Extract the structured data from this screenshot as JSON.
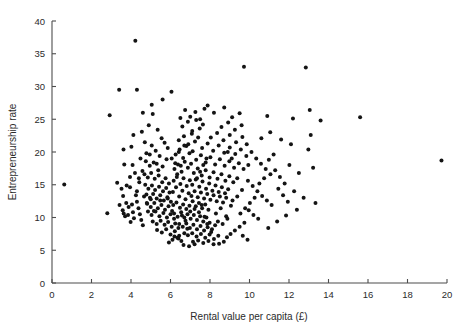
{
  "chart_data": {
    "type": "scatter",
    "title": "",
    "xlabel": "Rental value per capita (£)",
    "ylabel": "Entrepreneurship rate",
    "xlim": [
      0,
      20
    ],
    "ylim": [
      0,
      40
    ],
    "xticks": [
      0,
      2,
      4,
      6,
      8,
      10,
      12,
      14,
      16,
      18,
      20
    ],
    "yticks": [
      0,
      5,
      10,
      15,
      20,
      25,
      30,
      35,
      40
    ],
    "grid": false,
    "legend": null,
    "marker": {
      "shape": "circle",
      "color": "#141414",
      "size_px": 4
    },
    "n_points": 430,
    "points": [
      [
        0.62,
        15.05
      ],
      [
        2.8,
        10.65
      ],
      [
        2.92,
        25.6
      ],
      [
        3.4,
        29.5
      ],
      [
        4.3,
        29.5
      ],
      [
        4.22,
        37.0
      ],
      [
        3.62,
        20.4
      ],
      [
        3.66,
        18.1
      ],
      [
        3.3,
        15.3
      ],
      [
        3.52,
        14.4
      ],
      [
        3.78,
        14.9
      ],
      [
        3.95,
        14.6
      ],
      [
        3.6,
        13.3
      ],
      [
        3.76,
        12.2
      ],
      [
        3.42,
        11.9
      ],
      [
        3.58,
        11.1
      ],
      [
        3.63,
        10.6
      ],
      [
        3.7,
        10.2
      ],
      [
        3.85,
        10.4
      ],
      [
        3.88,
        11.6
      ],
      [
        4.05,
        12.0
      ],
      [
        4.1,
        10.8
      ],
      [
        4.15,
        9.9
      ],
      [
        3.98,
        9.3
      ],
      [
        4.25,
        13.4
      ],
      [
        4.3,
        12.4
      ],
      [
        4.38,
        11.4
      ],
      [
        4.45,
        10.5
      ],
      [
        4.52,
        9.6
      ],
      [
        4.6,
        8.8
      ],
      [
        4.12,
        22.6
      ],
      [
        4.55,
        23.1
      ],
      [
        4.02,
        20.8
      ],
      [
        4.48,
        19.0
      ],
      [
        4.7,
        21.5
      ],
      [
        4.9,
        24.1
      ],
      [
        5.1,
        25.8
      ],
      [
        5.35,
        23.4
      ],
      [
        5.55,
        22.1
      ],
      [
        5.05,
        21.0
      ],
      [
        5.25,
        20.2
      ],
      [
        5.45,
        19.4
      ],
      [
        4.75,
        18.6
      ],
      [
        4.95,
        17.9
      ],
      [
        5.15,
        18.4
      ],
      [
        5.38,
        17.2
      ],
      [
        5.6,
        17.8
      ],
      [
        5.8,
        18.9
      ],
      [
        4.68,
        16.6
      ],
      [
        4.85,
        16.1
      ],
      [
        5.02,
        16.8
      ],
      [
        5.2,
        15.9
      ],
      [
        5.4,
        16.4
      ],
      [
        5.58,
        15.4
      ],
      [
        5.75,
        16.0
      ],
      [
        5.92,
        15.2
      ],
      [
        4.72,
        15.0
      ],
      [
        4.88,
        14.4
      ],
      [
        5.06,
        14.9
      ],
      [
        5.22,
        14.2
      ],
      [
        5.42,
        14.7
      ],
      [
        5.62,
        14.0
      ],
      [
        5.78,
        14.5
      ],
      [
        5.95,
        13.8
      ],
      [
        4.78,
        13.5
      ],
      [
        4.96,
        13.0
      ],
      [
        5.12,
        13.6
      ],
      [
        5.3,
        12.9
      ],
      [
        5.48,
        13.4
      ],
      [
        5.66,
        12.6
      ],
      [
        5.84,
        13.1
      ],
      [
        6.02,
        12.4
      ],
      [
        4.82,
        12.1
      ],
      [
        5.0,
        11.6
      ],
      [
        5.18,
        12.2
      ],
      [
        5.36,
        11.4
      ],
      [
        5.54,
        11.9
      ],
      [
        5.72,
        11.2
      ],
      [
        5.9,
        11.7
      ],
      [
        6.08,
        11.0
      ],
      [
        4.86,
        10.9
      ],
      [
        5.04,
        10.4
      ],
      [
        5.24,
        10.9
      ],
      [
        5.44,
        10.2
      ],
      [
        5.64,
        10.7
      ],
      [
        5.82,
        10.0
      ],
      [
        6.0,
        10.5
      ],
      [
        6.18,
        9.8
      ],
      [
        5.1,
        9.4
      ],
      [
        5.3,
        9.0
      ],
      [
        5.5,
        9.5
      ],
      [
        5.7,
        8.9
      ],
      [
        5.88,
        9.3
      ],
      [
        6.06,
        8.6
      ],
      [
        6.24,
        9.1
      ],
      [
        6.4,
        8.4
      ],
      [
        5.32,
        8.1
      ],
      [
        5.56,
        7.7
      ],
      [
        5.78,
        8.2
      ],
      [
        6.0,
        7.4
      ],
      [
        6.22,
        7.9
      ],
      [
        6.44,
        7.2
      ],
      [
        6.1,
        6.6
      ],
      [
        6.35,
        6.9
      ],
      [
        5.92,
        6.2
      ],
      [
        6.55,
        6.4
      ],
      [
        6.7,
        7.6
      ],
      [
        6.85,
        8.3
      ],
      [
        6.12,
        13.9
      ],
      [
        6.28,
        14.6
      ],
      [
        6.44,
        13.2
      ],
      [
        6.6,
        14.1
      ],
      [
        6.76,
        12.8
      ],
      [
        6.92,
        13.7
      ],
      [
        6.16,
        15.6
      ],
      [
        6.32,
        16.2
      ],
      [
        6.5,
        15.1
      ],
      [
        6.66,
        16.0
      ],
      [
        6.82,
        14.8
      ],
      [
        6.98,
        15.7
      ],
      [
        6.2,
        17.4
      ],
      [
        6.38,
        18.1
      ],
      [
        6.56,
        17.0
      ],
      [
        6.72,
        18.5
      ],
      [
        6.88,
        17.6
      ],
      [
        7.04,
        18.2
      ],
      [
        6.26,
        19.6
      ],
      [
        6.46,
        20.4
      ],
      [
        6.64,
        19.1
      ],
      [
        6.8,
        20.9
      ],
      [
        6.96,
        19.8
      ],
      [
        7.12,
        20.1
      ],
      [
        6.42,
        21.8
      ],
      [
        6.68,
        22.4
      ],
      [
        6.9,
        21.2
      ],
      [
        7.08,
        22.8
      ],
      [
        7.24,
        21.6
      ],
      [
        7.4,
        22.2
      ],
      [
        6.6,
        23.9
      ],
      [
        6.88,
        24.6
      ],
      [
        7.1,
        23.2
      ],
      [
        7.3,
        24.9
      ],
      [
        7.48,
        23.6
      ],
      [
        7.64,
        24.2
      ],
      [
        7.0,
        25.4
      ],
      [
        7.26,
        26.1
      ],
      [
        7.5,
        25.0
      ],
      [
        7.72,
        26.6
      ],
      [
        6.74,
        26.4
      ],
      [
        6.5,
        25.2
      ],
      [
        6.14,
        11.9
      ],
      [
        6.3,
        12.3
      ],
      [
        6.48,
        11.5
      ],
      [
        6.64,
        12.0
      ],
      [
        6.8,
        11.3
      ],
      [
        6.96,
        11.8
      ],
      [
        7.12,
        12.5
      ],
      [
        7.28,
        11.7
      ],
      [
        7.44,
        12.2
      ],
      [
        7.6,
        11.4
      ],
      [
        7.76,
        12.0
      ],
      [
        7.92,
        11.2
      ],
      [
        6.18,
        10.6
      ],
      [
        6.36,
        10.1
      ],
      [
        6.54,
        10.8
      ],
      [
        6.7,
        10.0
      ],
      [
        6.86,
        10.5
      ],
      [
        7.02,
        9.8
      ],
      [
        7.18,
        10.4
      ],
      [
        7.34,
        9.6
      ],
      [
        7.5,
        10.2
      ],
      [
        7.66,
        9.4
      ],
      [
        7.82,
        10.0
      ],
      [
        7.98,
        9.2
      ],
      [
        6.44,
        9.0
      ],
      [
        6.62,
        8.6
      ],
      [
        6.8,
        9.1
      ],
      [
        6.98,
        8.4
      ],
      [
        7.16,
        8.9
      ],
      [
        7.34,
        8.2
      ],
      [
        7.52,
        8.7
      ],
      [
        7.7,
        8.0
      ],
      [
        7.88,
        8.5
      ],
      [
        8.06,
        7.8
      ],
      [
        6.88,
        7.3
      ],
      [
        7.1,
        7.6
      ],
      [
        7.32,
        7.1
      ],
      [
        7.54,
        7.5
      ],
      [
        7.76,
        6.9
      ],
      [
        7.98,
        7.4
      ],
      [
        8.2,
        6.7
      ],
      [
        8.42,
        7.2
      ],
      [
        7.14,
        6.3
      ],
      [
        7.4,
        6.5
      ],
      [
        7.66,
        6.1
      ],
      [
        7.92,
        6.4
      ],
      [
        8.18,
        5.9
      ],
      [
        6.66,
        5.8
      ],
      [
        6.94,
        5.6
      ],
      [
        7.22,
        5.9
      ],
      [
        8.46,
        6.0
      ],
      [
        8.7,
        6.3
      ],
      [
        6.4,
        6.8
      ],
      [
        6.2,
        7.1
      ],
      [
        7.06,
        13.3
      ],
      [
        7.22,
        14.0
      ],
      [
        7.38,
        13.1
      ],
      [
        7.54,
        13.8
      ],
      [
        7.7,
        12.9
      ],
      [
        7.86,
        13.6
      ],
      [
        8.02,
        12.7
      ],
      [
        8.18,
        13.4
      ],
      [
        8.34,
        12.5
      ],
      [
        8.5,
        13.2
      ],
      [
        8.66,
        12.3
      ],
      [
        8.82,
        13.0
      ],
      [
        7.1,
        15.0
      ],
      [
        7.28,
        15.8
      ],
      [
        7.46,
        14.7
      ],
      [
        7.62,
        15.5
      ],
      [
        7.8,
        14.4
      ],
      [
        7.96,
        15.2
      ],
      [
        8.12,
        14.1
      ],
      [
        8.28,
        14.9
      ],
      [
        8.44,
        13.9
      ],
      [
        8.6,
        14.6
      ],
      [
        8.76,
        13.7
      ],
      [
        8.92,
        14.3
      ],
      [
        7.18,
        16.8
      ],
      [
        7.38,
        17.5
      ],
      [
        7.58,
        16.4
      ],
      [
        7.78,
        17.2
      ],
      [
        7.98,
        16.1
      ],
      [
        8.18,
        16.9
      ],
      [
        8.38,
        15.9
      ],
      [
        8.58,
        16.6
      ],
      [
        8.78,
        15.6
      ],
      [
        8.98,
        16.3
      ],
      [
        9.18,
        15.4
      ],
      [
        9.38,
        16.0
      ],
      [
        7.3,
        18.8
      ],
      [
        7.54,
        19.5
      ],
      [
        7.78,
        18.4
      ],
      [
        8.02,
        19.2
      ],
      [
        8.26,
        18.1
      ],
      [
        8.5,
        18.9
      ],
      [
        8.74,
        17.9
      ],
      [
        8.98,
        18.6
      ],
      [
        9.22,
        17.6
      ],
      [
        9.46,
        18.3
      ],
      [
        9.7,
        17.4
      ],
      [
        9.94,
        18.0
      ],
      [
        7.6,
        20.6
      ],
      [
        7.88,
        21.3
      ],
      [
        8.16,
        20.2
      ],
      [
        8.44,
        21.0
      ],
      [
        8.72,
        19.9
      ],
      [
        9.0,
        20.7
      ],
      [
        9.28,
        19.7
      ],
      [
        9.56,
        20.4
      ],
      [
        9.84,
        19.4
      ],
      [
        8.04,
        22.2
      ],
      [
        8.36,
        22.9
      ],
      [
        8.68,
        21.8
      ],
      [
        9.0,
        22.6
      ],
      [
        9.32,
        21.5
      ],
      [
        9.64,
        22.3
      ],
      [
        8.58,
        23.8
      ],
      [
        8.92,
        24.5
      ],
      [
        9.26,
        23.4
      ],
      [
        9.6,
        24.1
      ],
      [
        9.12,
        25.3
      ],
      [
        9.5,
        25.9
      ],
      [
        8.2,
        26.0
      ],
      [
        7.88,
        27.1
      ],
      [
        8.72,
        26.8
      ],
      [
        9.86,
        21.2
      ],
      [
        10.1,
        20.0
      ],
      [
        10.34,
        19.0
      ],
      [
        10.58,
        18.2
      ],
      [
        10.82,
        17.4
      ],
      [
        11.06,
        16.6
      ],
      [
        9.92,
        15.6
      ],
      [
        10.16,
        14.8
      ],
      [
        10.4,
        14.0
      ],
      [
        10.64,
        13.3
      ],
      [
        10.88,
        12.6
      ],
      [
        11.12,
        11.9
      ],
      [
        9.96,
        11.1
      ],
      [
        10.2,
        10.4
      ],
      [
        10.44,
        9.8
      ],
      [
        9.74,
        9.2
      ],
      [
        9.5,
        8.6
      ],
      [
        9.26,
        8.0
      ],
      [
        9.04,
        7.5
      ],
      [
        8.86,
        7.0
      ],
      [
        9.54,
        10.6
      ],
      [
        9.78,
        11.4
      ],
      [
        10.02,
        12.2
      ],
      [
        10.26,
        13.0
      ],
      [
        10.5,
        15.2
      ],
      [
        10.74,
        16.0
      ],
      [
        10.98,
        18.8
      ],
      [
        11.22,
        19.6
      ],
      [
        11.46,
        14.4
      ],
      [
        11.7,
        13.4
      ],
      [
        11.94,
        12.4
      ],
      [
        11.3,
        17.2
      ],
      [
        11.54,
        16.2
      ],
      [
        11.78,
        15.2
      ],
      [
        12.02,
        18.0
      ],
      [
        12.26,
        14.0
      ],
      [
        12.5,
        16.8
      ],
      [
        12.74,
        13.0
      ],
      [
        12.98,
        20.4
      ],
      [
        13.1,
        22.6
      ],
      [
        13.22,
        17.6
      ],
      [
        13.34,
        12.2
      ],
      [
        12.1,
        21.2
      ],
      [
        11.6,
        21.9
      ],
      [
        11.05,
        23.0
      ],
      [
        10.6,
        22.1
      ],
      [
        10.9,
        25.5
      ],
      [
        12.2,
        25.1
      ],
      [
        12.4,
        11.2
      ],
      [
        11.85,
        10.3
      ],
      [
        11.4,
        9.4
      ],
      [
        10.95,
        8.4
      ],
      [
        9.66,
        7.2
      ],
      [
        9.9,
        6.6
      ],
      [
        15.6,
        25.3
      ],
      [
        19.72,
        18.7
      ],
      [
        13.6,
        24.8
      ],
      [
        13.05,
        26.4
      ],
      [
        12.85,
        32.9
      ],
      [
        9.72,
        33.0
      ],
      [
        4.6,
        26.0
      ],
      [
        5.05,
        27.2
      ],
      [
        5.6,
        28.0
      ],
      [
        6.05,
        29.2
      ],
      [
        4.95,
        19.6
      ],
      [
        5.3,
        18.2
      ],
      [
        6.58,
        10.3
      ],
      [
        6.76,
        9.5
      ],
      [
        7.0,
        10.9
      ],
      [
        7.22,
        11.3
      ],
      [
        5.48,
        12.6
      ],
      [
        5.86,
        12.9
      ],
      [
        6.34,
        16.6
      ],
      [
        6.52,
        17.9
      ],
      [
        4.4,
        16.0
      ],
      [
        4.58,
        17.1
      ],
      [
        4.78,
        19.8
      ],
      [
        4.3,
        14.0
      ],
      [
        4.42,
        15.4
      ],
      [
        4.2,
        16.8
      ],
      [
        4.08,
        18.0
      ],
      [
        3.95,
        16.2
      ],
      [
        4.66,
        13.2
      ],
      [
        4.8,
        12.2
      ],
      [
        5.0,
        12.8
      ],
      [
        5.16,
        11.0
      ],
      [
        8.3,
        10.6
      ],
      [
        8.54,
        11.4
      ],
      [
        8.82,
        10.2
      ],
      [
        9.06,
        11.8
      ],
      [
        8.4,
        9.4
      ],
      [
        8.64,
        9.0
      ],
      [
        8.88,
        9.8
      ],
      [
        9.14,
        12.6
      ],
      [
        9.38,
        13.2
      ],
      [
        9.62,
        14.2
      ],
      [
        7.44,
        10.8
      ],
      [
        7.58,
        11.9
      ],
      [
        7.72,
        10.1
      ],
      [
        7.86,
        9.0
      ],
      [
        8.1,
        8.2
      ],
      [
        8.26,
        8.8
      ],
      [
        6.06,
        19.0
      ],
      [
        6.24,
        18.3
      ],
      [
        6.42,
        20.0
      ],
      [
        5.86,
        20.6
      ],
      [
        5.7,
        21.4
      ],
      [
        6.7,
        21.0
      ],
      [
        7.34,
        16.0
      ],
      [
        7.5,
        17.0
      ],
      [
        7.66,
        18.0
      ],
      [
        7.82,
        19.0
      ],
      [
        8.9,
        20.0
      ],
      [
        9.1,
        19.0
      ]
    ]
  },
  "axes": {
    "x_tick_labels": [
      "0",
      "2",
      "4",
      "6",
      "8",
      "10",
      "12",
      "14",
      "16",
      "18",
      "20"
    ],
    "y_tick_labels": [
      "0",
      "5",
      "10",
      "15",
      "20",
      "25",
      "30",
      "35",
      "40"
    ],
    "x_title": "Rental value per capita (£)",
    "y_title": "Entrepreneurship rate"
  },
  "colors": {
    "marker": "#141414",
    "axis": "#4d4d4d",
    "text": "#2b2b2b",
    "background": "#ffffff"
  }
}
